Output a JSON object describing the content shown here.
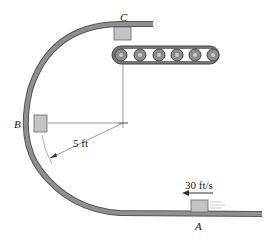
{
  "diagram": {
    "labels": {
      "point_a": "A",
      "point_b": "B",
      "point_c": "C",
      "radius": "5 ft",
      "speed": "30 ft/s"
    },
    "colors": {
      "track": "#8a8a8a",
      "track_edge": "#555555",
      "block": "#c4c4c4",
      "roller": "#8c8c8c",
      "line": "#444444"
    },
    "conveyor": {
      "roller_count": 6
    }
  }
}
